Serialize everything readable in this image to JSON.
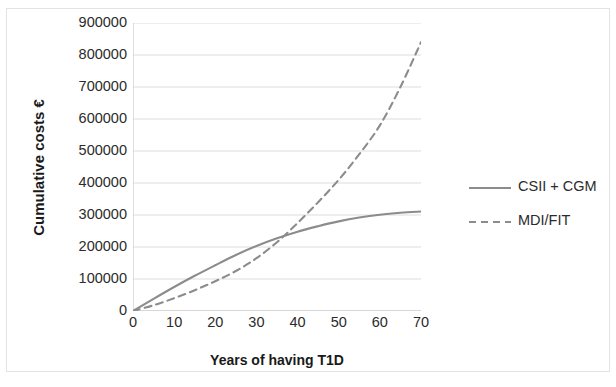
{
  "chart_data": {
    "type": "line",
    "title": "",
    "xlabel": "Years of having T1D",
    "ylabel": "Cumulative costs  €",
    "ylabel_text": "Cumulative costs",
    "ylabel_currency": "€",
    "xlim": [
      0,
      70
    ],
    "ylim": [
      0,
      900000
    ],
    "grid": "horizontal",
    "legend_position": "right",
    "xticks": [
      "0",
      "10",
      "20",
      "30",
      "40",
      "50",
      "60",
      "70"
    ],
    "xtick_values": [
      0,
      10,
      20,
      30,
      40,
      50,
      60,
      70
    ],
    "yticks": [
      "0",
      "100000",
      "200000",
      "300000",
      "400000",
      "500000",
      "600000",
      "700000",
      "800000",
      "900000"
    ],
    "ytick_values": [
      0,
      100000,
      200000,
      300000,
      400000,
      500000,
      600000,
      700000,
      800000,
      900000
    ],
    "x": [
      0,
      5,
      10,
      15,
      20,
      25,
      30,
      35,
      40,
      45,
      50,
      55,
      60,
      65,
      70
    ],
    "series": [
      {
        "name": "CSII + CGM",
        "style": "solid",
        "color": "#8c8c8c",
        "values": [
          0,
          38000,
          75000,
          110000,
          143000,
          175000,
          203000,
          227000,
          248000,
          265000,
          280000,
          292000,
          301000,
          307000,
          311000
        ]
      },
      {
        "name": "MDI/FIT",
        "style": "dashed",
        "color": "#8c8c8c",
        "values": [
          0,
          18000,
          40000,
          65000,
          93000,
          125000,
          165000,
          215000,
          275000,
          340000,
          410000,
          490000,
          580000,
          700000,
          840000
        ]
      }
    ],
    "annotations": [],
    "crossover": {
      "x": 27,
      "y": 190000
    }
  },
  "legend": {
    "items": [
      {
        "label": "CSII + CGM",
        "style": "solid",
        "color": "#8c8c8c"
      },
      {
        "label": "MDI/FIT",
        "style": "dashed",
        "color": "#8c8c8c"
      }
    ]
  },
  "colors": {
    "series_gray": "#8c8c8c",
    "gridline": "#d9d9d9",
    "axis": "#bfbfbf",
    "frame_border": "#e3e3e3",
    "text": "#2b2b2b"
  }
}
